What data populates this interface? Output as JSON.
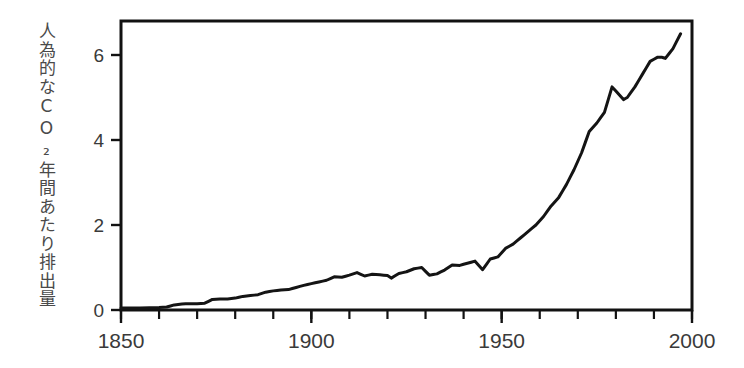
{
  "chart_data": {
    "type": "line",
    "title": "",
    "subtitle": "",
    "xlabel": "",
    "ylabel": "人為的なCO₂年間あたり排出量",
    "xlim": [
      1850,
      2000
    ],
    "ylim": [
      0,
      6.8
    ],
    "grid": false,
    "legend": "none",
    "line_color": "#141414",
    "background_color": "#ffffff",
    "xticks": [
      1850,
      1900,
      1950,
      2000
    ],
    "xtick_labels": [
      "1850",
      "1900",
      "1950",
      "2000"
    ],
    "xtick_minor_step": 10,
    "yticks": [
      0,
      2,
      4,
      6
    ],
    "ytick_labels": [
      "0",
      "2",
      "4",
      "6"
    ],
    "series": [
      {
        "name": "人為的なCO₂年間あたり排出量",
        "x": [
          1850,
          1855,
          1860,
          1862,
          1864,
          1866,
          1868,
          1870,
          1872,
          1874,
          1876,
          1878,
          1880,
          1882,
          1884,
          1886,
          1888,
          1890,
          1892,
          1894,
          1896,
          1898,
          1900,
          1902,
          1904,
          1906,
          1908,
          1910,
          1912,
          1914,
          1916,
          1918,
          1920,
          1921,
          1923,
          1925,
          1927,
          1929,
          1931,
          1933,
          1935,
          1937,
          1939,
          1941,
          1943,
          1945,
          1947,
          1949,
          1951,
          1953,
          1955,
          1957,
          1959,
          1961,
          1963,
          1965,
          1967,
          1969,
          1971,
          1973,
          1975,
          1977,
          1979,
          1980,
          1982,
          1983,
          1985,
          1987,
          1989,
          1991,
          1992,
          1993,
          1995,
          1997
        ],
        "values": [
          0.05,
          0.05,
          0.06,
          0.07,
          0.12,
          0.14,
          0.15,
          0.15,
          0.16,
          0.25,
          0.26,
          0.26,
          0.28,
          0.32,
          0.34,
          0.36,
          0.42,
          0.45,
          0.47,
          0.48,
          0.53,
          0.58,
          0.62,
          0.66,
          0.7,
          0.78,
          0.77,
          0.82,
          0.88,
          0.8,
          0.84,
          0.83,
          0.81,
          0.75,
          0.86,
          0.9,
          0.97,
          1.0,
          0.82,
          0.85,
          0.94,
          1.06,
          1.05,
          1.1,
          1.15,
          0.95,
          1.2,
          1.25,
          1.45,
          1.55,
          1.7,
          1.85,
          2.0,
          2.2,
          2.45,
          2.65,
          2.95,
          3.3,
          3.7,
          4.2,
          4.4,
          4.65,
          5.25,
          5.15,
          4.95,
          5.0,
          5.25,
          5.55,
          5.85,
          5.95,
          5.95,
          5.92,
          6.15,
          6.5
        ]
      }
    ],
    "annotations": []
  },
  "axis": {
    "y_label_text": "人為的なCO₂年間あたり排出量"
  }
}
